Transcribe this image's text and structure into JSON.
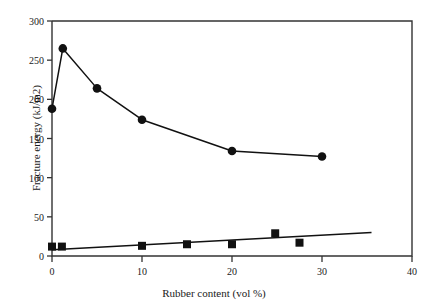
{
  "chart_data": {
    "type": "line",
    "title": "",
    "xlabel": "Rubber content (vol %)",
    "ylabel": "Fracture energy (kJ/m2)",
    "xlim": [
      0,
      40
    ],
    "ylim": [
      0,
      300
    ],
    "xticks": [
      0,
      10,
      20,
      30,
      40
    ],
    "yticks": [
      0,
      50,
      100,
      150,
      200,
      250,
      300
    ],
    "xtick_labels": [
      "0",
      "10",
      "20",
      "30",
      "40"
    ],
    "ytick_labels": [
      "0",
      "50",
      "100",
      "150",
      "200",
      "250",
      "300"
    ],
    "grid": false,
    "legend": "none",
    "series": [
      {
        "name": "fracture-energy-circles",
        "marker": "filled-circle",
        "connected": true,
        "color": "#111111",
        "points": [
          {
            "x": 0,
            "y": 188
          },
          {
            "x": 1.2,
            "y": 265
          },
          {
            "x": 5,
            "y": 214
          },
          {
            "x": 10,
            "y": 174
          },
          {
            "x": 20,
            "y": 134
          },
          {
            "x": 30,
            "y": 127
          }
        ]
      },
      {
        "name": "fracture-energy-squares",
        "marker": "filled-square",
        "connected": false,
        "color": "#111111",
        "points": [
          {
            "x": 0,
            "y": 12
          },
          {
            "x": 1.1,
            "y": 12
          },
          {
            "x": 10,
            "y": 13
          },
          {
            "x": 15,
            "y": 15
          },
          {
            "x": 20,
            "y": 15
          },
          {
            "x": 24.8,
            "y": 29
          },
          {
            "x": 27.5,
            "y": 17
          }
        ]
      }
    ],
    "trendlines": [
      {
        "name": "square-series-trendline",
        "color": "#111111",
        "x0": 0,
        "y0": 8,
        "x1": 35.5,
        "y1": 30
      }
    ]
  },
  "axes": {
    "frame_color": "#333333",
    "tick_color": "#333333"
  }
}
